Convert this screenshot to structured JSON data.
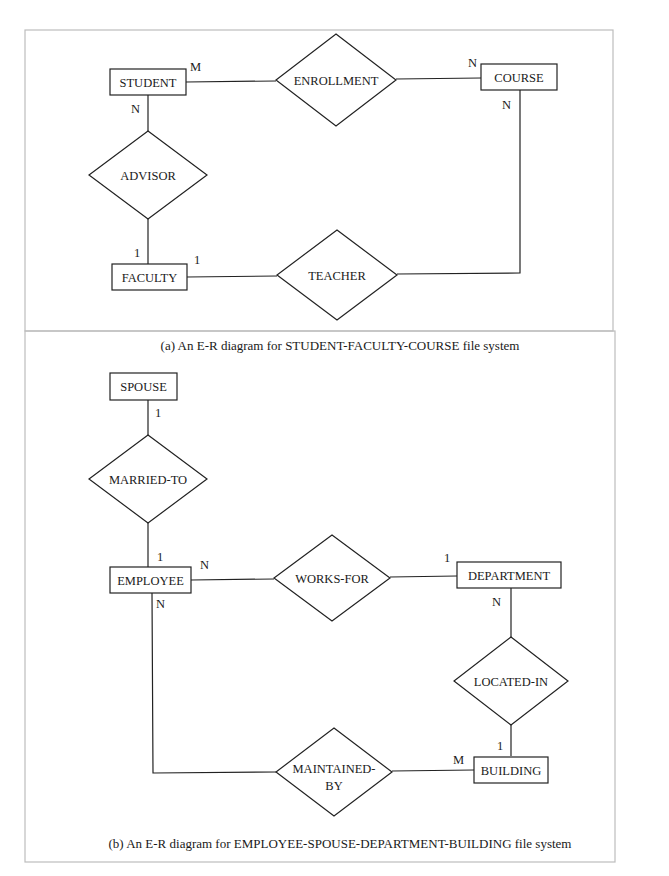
{
  "diagrams": [
    {
      "caption": "(a) An E-R diagram for STUDENT-FACULTY-COURSE file system",
      "entities": {
        "student": "STUDENT",
        "course": "COURSE",
        "faculty": "FACULTY"
      },
      "relationships": {
        "enrollment": "ENROLLMENT",
        "advisor": "ADVISOR",
        "teacher": "TEACHER"
      },
      "cardinalities": {
        "student_enrollment": "M",
        "course_enrollment": "N",
        "student_advisor": "N",
        "faculty_advisor": "1",
        "faculty_teacher": "1",
        "course_teacher": "N"
      }
    },
    {
      "caption": "(b) An E-R diagram for EMPLOYEE-SPOUSE-DEPARTMENT-BUILDING file system",
      "entities": {
        "spouse": "SPOUSE",
        "employee": "EMPLOYEE",
        "department": "DEPARTMENT",
        "building": "BUILDING"
      },
      "relationships": {
        "married_to": "MARRIED-TO",
        "works_for": "WORKS-FOR",
        "located_in": "LOCATED-IN",
        "maintained_by_line1": "MAINTAINED-",
        "maintained_by_line2": "BY"
      },
      "cardinalities": {
        "spouse_married": "1",
        "employee_married": "1",
        "employee_works": "N",
        "department_works": "1",
        "department_located": "N",
        "building_located": "1",
        "employee_maintained": "N",
        "building_maintained": "M"
      }
    }
  ]
}
